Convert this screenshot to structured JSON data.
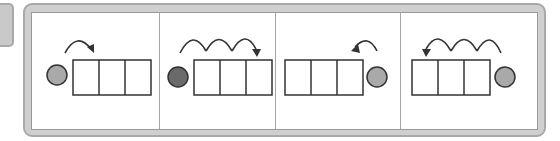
{
  "colors": {
    "frame": "#cfcfcf",
    "frame_border": "#a9a9a9",
    "panel_bg": "#ffffff",
    "divider": "#a6a6a6",
    "cell_stroke": "#333333",
    "circle_light": "#a9a9a9",
    "circle_dark": "#6a6a6a",
    "arrow": "#333333"
  },
  "panels": [
    {
      "id": 1,
      "circle_position": "left",
      "circle_shade": "light",
      "boxes": 3,
      "arcs": 1,
      "arrow_direction": "right"
    },
    {
      "id": 2,
      "circle_position": "left",
      "circle_shade": "dark",
      "boxes": 3,
      "arcs": 3,
      "arrow_direction": "right"
    },
    {
      "id": 3,
      "circle_position": "right",
      "circle_shade": "light",
      "boxes": 3,
      "arcs": 1,
      "arrow_direction": "left"
    },
    {
      "id": 4,
      "circle_position": "right",
      "circle_shade": "light",
      "boxes": 3,
      "arcs": 3,
      "arrow_direction": "left"
    }
  ]
}
